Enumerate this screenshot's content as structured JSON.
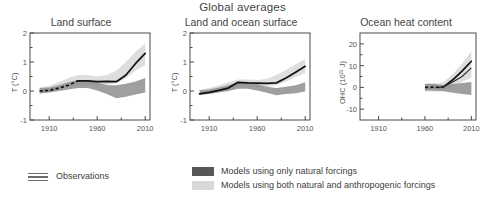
{
  "figure": {
    "title": "Global averages",
    "legend": {
      "observations_label": "Observations",
      "observations_icon": "triple-line-icon",
      "natural_label": "Models using only natural forcings",
      "anthro_label": "Models using both natural and anthropogenic forcings",
      "natural_color": "#575757",
      "anthro_color": "#d9d9d9",
      "observation_color": "#111111"
    }
  },
  "chart_data": [
    {
      "type": "line",
      "title": "Land surface",
      "xlabel": "",
      "ylabel": "T (°C)",
      "xlim": [
        1890,
        2015
      ],
      "ylim": [
        -1,
        2
      ],
      "xticks": [
        1910,
        1960,
        2010
      ],
      "xticklabels": [
        "1910",
        "1960",
        "2010"
      ],
      "yticks": [
        -1,
        0,
        1,
        2
      ],
      "yticklabels": [
        "-1",
        "0",
        "1",
        "2"
      ],
      "minor_xticks": [
        1935,
        1985
      ],
      "minor_yticks": [
        -0.5,
        0.5,
        1.5
      ],
      "grid": false,
      "legend_position": "below-figure",
      "series": [
        {
          "name": "Observations",
          "style": "solid-black-with-dashed-early",
          "x": [
            1900,
            1910,
            1920,
            1930,
            1940,
            1950,
            1960,
            1970,
            1980,
            1990,
            2000,
            2010
          ],
          "values": [
            0.0,
            0.02,
            0.1,
            0.2,
            0.35,
            0.35,
            0.32,
            0.33,
            0.32,
            0.55,
            0.95,
            1.3
          ]
        },
        {
          "name": "Models using only natural forcings",
          "style": "dark-gray-band",
          "x": [
            1900,
            1910,
            1920,
            1930,
            1940,
            1950,
            1960,
            1970,
            1980,
            1990,
            2000,
            2010
          ],
          "upper": [
            0.1,
            0.12,
            0.2,
            0.3,
            0.38,
            0.38,
            0.3,
            0.2,
            0.2,
            0.25,
            0.33,
            0.45
          ],
          "lower": [
            -0.08,
            -0.05,
            0.0,
            0.05,
            0.1,
            0.1,
            0.02,
            -0.1,
            -0.25,
            -0.2,
            -0.12,
            -0.05
          ]
        },
        {
          "name": "Models using both natural and anthropogenic forcings",
          "style": "light-gray-band",
          "x": [
            1900,
            1910,
            1920,
            1930,
            1940,
            1950,
            1960,
            1970,
            1980,
            1990,
            2000,
            2010
          ],
          "upper": [
            0.12,
            0.18,
            0.3,
            0.45,
            0.55,
            0.55,
            0.5,
            0.55,
            0.7,
            1.0,
            1.35,
            1.65
          ],
          "lower": [
            -0.1,
            -0.05,
            0.02,
            0.12,
            0.2,
            0.2,
            0.18,
            0.2,
            0.28,
            0.45,
            0.7,
            0.9
          ]
        }
      ]
    },
    {
      "type": "line",
      "title": "Land and ocean surface",
      "xlabel": "",
      "ylabel": "T (°C)",
      "xlim": [
        1890,
        2015
      ],
      "ylim": [
        -1,
        2
      ],
      "xticks": [
        1910,
        1960,
        2010
      ],
      "xticklabels": [
        "1910",
        "1960",
        "2010"
      ],
      "yticks": [
        -1,
        0,
        1,
        2
      ],
      "yticklabels": [
        "-1",
        "0",
        "1",
        "2"
      ],
      "minor_xticks": [
        1935,
        1985
      ],
      "minor_yticks": [
        -0.5,
        0.5,
        1.5
      ],
      "grid": false,
      "legend_position": "below-figure",
      "series": [
        {
          "name": "Observations",
          "style": "solid-black",
          "x": [
            1900,
            1910,
            1920,
            1930,
            1940,
            1950,
            1960,
            1970,
            1980,
            1990,
            2000,
            2010
          ],
          "values": [
            -0.1,
            -0.05,
            0.02,
            0.1,
            0.3,
            0.28,
            0.27,
            0.26,
            0.28,
            0.45,
            0.65,
            0.85
          ]
        },
        {
          "name": "Models using only natural forcings",
          "style": "dark-gray-band",
          "x": [
            1900,
            1910,
            1920,
            1930,
            1940,
            1950,
            1960,
            1970,
            1980,
            1990,
            2000,
            2010
          ],
          "upper": [
            0.02,
            0.05,
            0.12,
            0.2,
            0.3,
            0.3,
            0.24,
            0.15,
            0.1,
            0.15,
            0.2,
            0.3
          ],
          "lower": [
            -0.13,
            -0.1,
            -0.05,
            0.0,
            0.08,
            0.08,
            0.02,
            -0.06,
            -0.15,
            -0.1,
            -0.08,
            -0.02
          ]
        },
        {
          "name": "Models using both natural and anthropogenic forcings",
          "style": "light-gray-band",
          "x": [
            1900,
            1910,
            1920,
            1930,
            1940,
            1950,
            1960,
            1970,
            1980,
            1990,
            2000,
            2010
          ],
          "upper": [
            0.05,
            0.1,
            0.2,
            0.3,
            0.4,
            0.4,
            0.38,
            0.42,
            0.55,
            0.72,
            0.92,
            1.1
          ],
          "lower": [
            -0.15,
            -0.1,
            -0.02,
            0.05,
            0.14,
            0.14,
            0.12,
            0.14,
            0.2,
            0.33,
            0.48,
            0.62
          ]
        }
      ]
    },
    {
      "type": "line",
      "title": "Ocean heat content",
      "xlabel": "",
      "ylabel": "OHC (10²² J)",
      "xlim": [
        1890,
        2015
      ],
      "ylim": [
        -15,
        25
      ],
      "xticks": [
        1910,
        1960,
        2010
      ],
      "xticklabels": [
        "1910",
        "1960",
        "2010"
      ],
      "yticks": [
        -10,
        0,
        10,
        20
      ],
      "yticklabels": [
        "-10",
        "0",
        "10",
        "20"
      ],
      "minor_xticks": [
        1935,
        1985
      ],
      "minor_yticks": [
        -5,
        5,
        15
      ],
      "grid": false,
      "legend_position": "below-figure",
      "series": [
        {
          "name": "Observations",
          "style": "dashed-then-solid-black",
          "x": [
            1960,
            1965,
            1970,
            1975,
            1980,
            1990,
            2000,
            2010
          ],
          "values": [
            0.0,
            0.0,
            0.1,
            0.0,
            0.2,
            3.5,
            7.5,
            12.0
          ]
        },
        {
          "name": "Observations (second estimate)",
          "style": "thin-black",
          "x": [
            1975,
            1980,
            1990,
            2000,
            2010
          ],
          "values": [
            0.0,
            0.3,
            2.5,
            5.0,
            9.0
          ]
        },
        {
          "name": "Models using only natural forcings",
          "style": "dark-gray-band",
          "x": [
            1960,
            1965,
            1970,
            1975,
            1980,
            1990,
            2000,
            2010
          ],
          "upper": [
            1.5,
            1.6,
            1.5,
            1.3,
            1.2,
            1.5,
            2.0,
            2.5
          ],
          "lower": [
            -1.5,
            -1.4,
            -1.5,
            -1.6,
            -1.8,
            -2.5,
            -3.0,
            -3.5
          ]
        },
        {
          "name": "Models using both natural and anthropogenic forcings",
          "style": "light-gray-band",
          "x": [
            1960,
            1965,
            1970,
            1975,
            1980,
            1990,
            2000,
            2010
          ],
          "upper": [
            1.8,
            2.0,
            2.0,
            1.8,
            2.5,
            6.0,
            11.0,
            16.5
          ],
          "lower": [
            -1.8,
            -1.8,
            -1.9,
            -2.0,
            -1.5,
            0.5,
            2.5,
            4.5
          ]
        }
      ]
    }
  ]
}
